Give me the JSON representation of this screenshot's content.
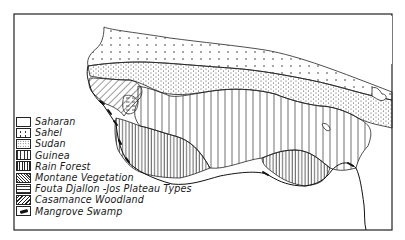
{
  "map": {
    "type": "vegetation zones",
    "region": "West Africa"
  },
  "legend": {
    "items": [
      {
        "key": "saharan",
        "label": "Saharan",
        "pattern": "blank"
      },
      {
        "key": "sahel",
        "label": "Sahel",
        "pattern": "sparse-dots"
      },
      {
        "key": "sudan",
        "label": "Sudan",
        "pattern": "dense-dots"
      },
      {
        "key": "guinea",
        "label": "Guinea",
        "pattern": "wide-vertical-lines"
      },
      {
        "key": "rainforest",
        "label": "Rain Forest",
        "pattern": "dense-vertical-lines"
      },
      {
        "key": "montane",
        "label": "Montane Vegetation",
        "pattern": "fine-diagonal-hatch"
      },
      {
        "key": "fouta",
        "label": "Fouta Djallon -Jos Plateau Types",
        "pattern": "dashed-horizontal"
      },
      {
        "key": "casamance",
        "label": "Casamance Woodland",
        "pattern": "bold-diagonal-hatch"
      },
      {
        "key": "mangrove",
        "label": "Mangrove Swamp",
        "pattern": "solid-black-mark"
      }
    ]
  },
  "colors": {
    "ink": "#1a1a1a",
    "paper": "#ffffff"
  }
}
